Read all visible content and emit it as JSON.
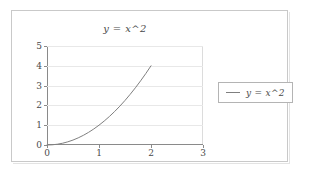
{
  "figure": {
    "background_color": "#ffffff",
    "frame_border_color": "#c9c9c9"
  },
  "chart_data": {
    "type": "line",
    "title": "y = x^2",
    "xlabel": "",
    "ylabel": "",
    "xlim": [
      0,
      3
    ],
    "ylim": [
      0,
      5
    ],
    "xticks": [
      "0",
      "1",
      "2",
      "3"
    ],
    "yticks": [
      "0",
      "1",
      "2",
      "3",
      "4",
      "5"
    ],
    "xtick_values": [
      0,
      1,
      2,
      3
    ],
    "ytick_values": [
      0,
      1,
      2,
      3,
      4,
      5
    ],
    "grid": true,
    "grid_axis": "y",
    "legend": {
      "position": "right-outside",
      "entries": [
        {
          "label": "y = x^2",
          "color": "#7f7f7f"
        }
      ]
    },
    "series": [
      {
        "name": "y = x^2",
        "color": "#7f7f7f",
        "line_width": 1,
        "x": [
          0,
          0.1,
          0.2,
          0.3,
          0.4,
          0.5,
          0.6,
          0.7,
          0.8,
          0.9,
          1.0,
          1.1,
          1.2,
          1.3,
          1.4,
          1.5,
          1.6,
          1.7,
          1.8,
          1.9,
          2.0
        ],
        "values": [
          0,
          0.01,
          0.04,
          0.09,
          0.16,
          0.25,
          0.36,
          0.49,
          0.64,
          0.81,
          1.0,
          1.21,
          1.44,
          1.69,
          1.96,
          2.25,
          2.56,
          2.89,
          3.24,
          3.61,
          4.0
        ]
      }
    ]
  },
  "legend": {
    "label": "y = x^2"
  }
}
